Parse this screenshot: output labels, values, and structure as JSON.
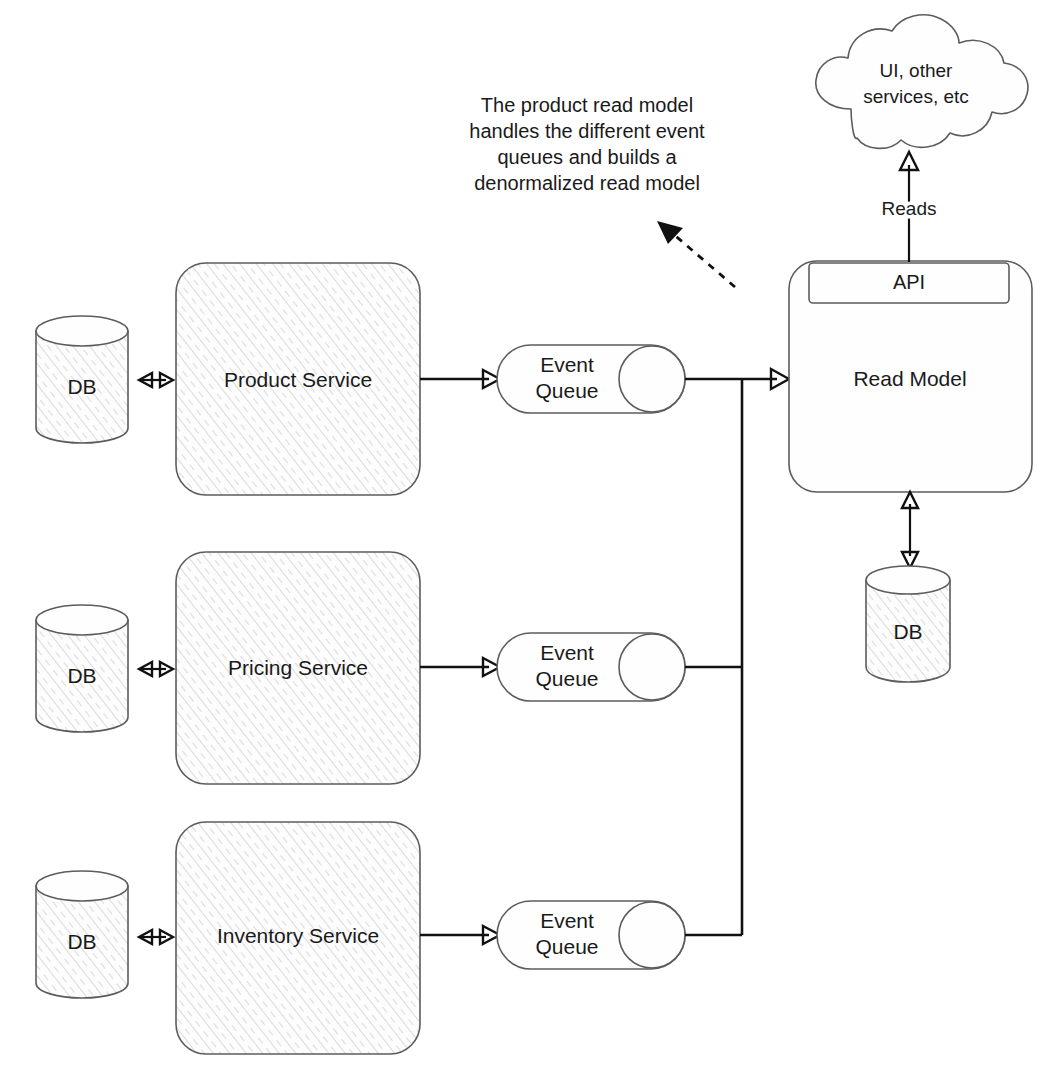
{
  "diagram": {
    "background_color": "#ffffff",
    "sketch_stroke_color": "#5c5c5c",
    "line_color": "#111111",
    "annotation": {
      "lines": [
        "The product read model",
        "handles the different event",
        "queues and builds a",
        "denormalized read model"
      ],
      "pointer": "dashed-arrow"
    },
    "cloud": {
      "lines": [
        "UI, other",
        "services, etc"
      ]
    },
    "read_model": {
      "label": "Read Model",
      "api_label": "API",
      "db_label": "DB"
    },
    "reads_edge_label": "Reads",
    "rows": [
      {
        "db_label": "DB",
        "service_label": "Product Service",
        "queue_lines": [
          "Event",
          "Queue"
        ]
      },
      {
        "db_label": "DB",
        "service_label": "Pricing Service",
        "queue_lines": [
          "Event",
          "Queue"
        ]
      },
      {
        "db_label": "DB",
        "service_label": "Inventory Service",
        "queue_lines": [
          "Event",
          "Queue"
        ]
      }
    ]
  }
}
